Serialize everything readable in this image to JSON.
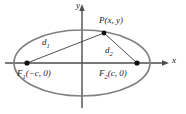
{
  "figure": {
    "kind": "ellipse-foci-diagram",
    "background_color": "#ffffff",
    "axis_color": "#4d4d4d",
    "curve_color": "#808080",
    "segment_color": "#3a3a3a",
    "point_color": "#111111",
    "text_color": "#1a1a1a"
  },
  "axes": {
    "x_label": "x",
    "y_label": "y",
    "origin": {
      "x": 82,
      "y": 63
    },
    "x_range_px": [
      4,
      170
    ],
    "y_range_px": [
      4,
      110
    ]
  },
  "curve": {
    "type": "ellipse",
    "center": {
      "x": 82,
      "y": 63
    },
    "semi_major_px": 68,
    "semi_minor_px": 33,
    "stroke_width": 1.6
  },
  "points": [
    {
      "name": "P",
      "label": "P(x, y)",
      "x": 104,
      "y": 33,
      "label_x": 100,
      "label_y": 17
    },
    {
      "name": "F1",
      "label": "F",
      "label_sub": "1",
      "label_rest": "(−c, 0)",
      "x": 27,
      "y": 63,
      "label_x": 18,
      "label_y": 70
    },
    {
      "name": "F2",
      "label": "F",
      "label_sub": "2",
      "label_rest": "(c, 0)",
      "x": 137,
      "y": 63,
      "label_x": 100,
      "label_y": 70
    }
  ],
  "segments": [
    {
      "name": "d1",
      "label": "d",
      "label_sub": "1",
      "from": "F1",
      "to": "P",
      "label_x": 43,
      "label_y": 39
    },
    {
      "name": "d2",
      "label": "d",
      "label_sub": "2",
      "from": "F2",
      "to": "P",
      "label_x": 106,
      "label_y": 47
    }
  ],
  "axis_labels": {
    "x": {
      "text": "x",
      "x": 172,
      "y": 58
    },
    "y": {
      "text": "y",
      "x": 76,
      "y": 2
    }
  }
}
